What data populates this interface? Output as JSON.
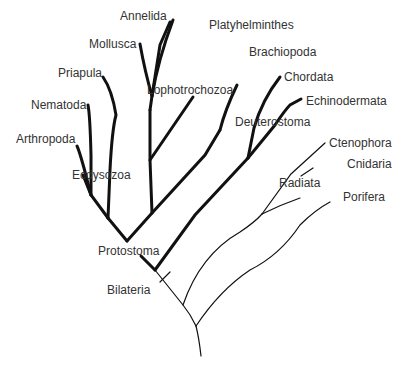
{
  "colors": {
    "line": "#111111",
    "text": "#333333",
    "background": "#ffffff"
  },
  "taxa": {
    "annelida": "Annelida",
    "platyhelminthes": "Platyhelminthes",
    "mollusca": "Mollusca",
    "brachiopoda": "Brachiopoda",
    "priapula": "Priapula",
    "chordata": "Chordata",
    "nematoda": "Nematoda",
    "echinodermata": "Echinodermata",
    "arthropoda": "Arthropoda",
    "ctenophora": "Ctenophora",
    "cnidaria": "Cnidaria",
    "porifera": "Porifera"
  },
  "clades": {
    "lophotrochozoa": "Lophotrochozoa",
    "ecdysozoa": "Ecdysozoa",
    "deuterostoma": "Deuterostoma",
    "radiata": "Radiata",
    "protostoma": "Protostoma",
    "bilateria": "Bilateria"
  }
}
